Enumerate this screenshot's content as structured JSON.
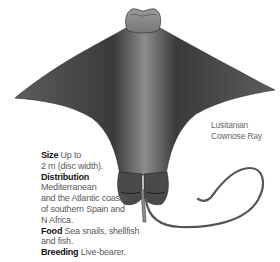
{
  "illustration": {
    "subject": "ray-illustration",
    "colors": {
      "body_dark": "#3b3b3b",
      "body_mid": "#6b6b6b",
      "body_light": "#9a9a9a",
      "background": "#ffffff"
    }
  },
  "label": {
    "line1": "Lusitanian",
    "line2": "Cownose Ray"
  },
  "facts": {
    "size": {
      "heading": "Size",
      "text1": " Up to",
      "text2": "2 m (disc width)."
    },
    "distribution": {
      "heading": "Distribution",
      "lines": [
        "Mediterranean",
        "and the Atlantic coasts",
        "of southern Spain and",
        "N Africa."
      ]
    },
    "food": {
      "heading": "Food",
      "text1": " Sea snails, shellfish",
      "text2": "and fish."
    },
    "breeding": {
      "heading": "Breeding",
      "text": " Live-bearer."
    }
  }
}
